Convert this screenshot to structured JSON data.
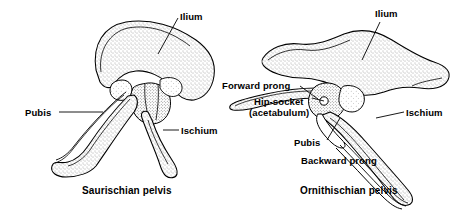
{
  "figure": {
    "background_color": "#ffffff",
    "line_color": "#000000",
    "fill_color": "#ffffff",
    "stipple_color": "#555555"
  },
  "left_diagram": {
    "caption": "Saurischian pelvis",
    "labels": {
      "ilium": "Ilium",
      "pubis": "Pubis",
      "ischium": "Ischium"
    }
  },
  "right_diagram": {
    "caption": "Ornithischian pelvis",
    "labels": {
      "ilium": "Ilium",
      "forward_prong": "Forward prong",
      "hip_socket_line1": "Hip-socket",
      "hip_socket_line2": "(acetabulum)",
      "pubis": "Pubis",
      "backward_prong": "Backward prong",
      "ischium": "Ischium"
    }
  }
}
